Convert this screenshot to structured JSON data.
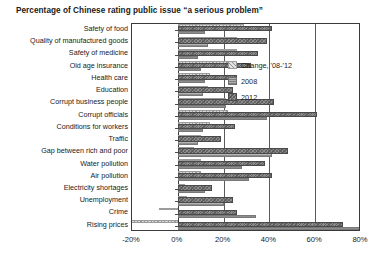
{
  "chart_data": {
    "type": "bar",
    "orientation": "horizontal",
    "title": "Percentage of Chinese rating public issue “a serious problem”",
    "xlabel": "",
    "ylabel": "",
    "xlim": [
      -20,
      80
    ],
    "xticks": [
      "-20%",
      "0%",
      "20%",
      "40%",
      "60%",
      "80%"
    ],
    "xtick_values": [
      -20,
      0,
      20,
      40,
      60,
      80
    ],
    "grid": true,
    "legend_position": "inside-upper-right",
    "categories": [
      "Safety of food",
      "Quality of manufactured goods",
      "Safety of medicine",
      "Old age insurance",
      "Health care",
      "Education",
      "Corrupt business people",
      "Corrupt officials",
      "Conditions for workers",
      "Traffic",
      "Gap between rich and poor",
      "Water pollution",
      "Air pollution",
      "Electricity shortages",
      "Unemployment",
      "Crime",
      "Rising prices"
    ],
    "series": [
      {
        "name": "Change, '08-'12",
        "color": "#d8d8d8",
        "values": [
          29,
          26,
          26,
          22,
          14,
          13,
          21,
          22,
          14,
          10,
          7,
          10,
          10,
          3,
          4,
          -8,
          -24
        ]
      },
      {
        "name": "2008",
        "color": "#a7a7a7",
        "values": [
          12,
          13,
          9,
          10,
          12,
          11,
          21,
          39,
          11,
          9,
          41,
          28,
          31,
          12,
          20,
          34,
          96
        ]
      },
      {
        "name": "2012",
        "color": "#8c8c8c",
        "values": [
          41,
          39,
          35,
          32,
          26,
          24,
          42,
          61,
          25,
          19,
          48,
          38,
          41,
          15,
          24,
          26,
          72
        ]
      }
    ]
  },
  "legend": {
    "items": [
      {
        "label": "Change, '08-'12",
        "swatch": "sw-change"
      },
      {
        "label": "2008",
        "swatch": "sw-2008"
      },
      {
        "label": "2012",
        "swatch": "sw-2012"
      }
    ]
  }
}
